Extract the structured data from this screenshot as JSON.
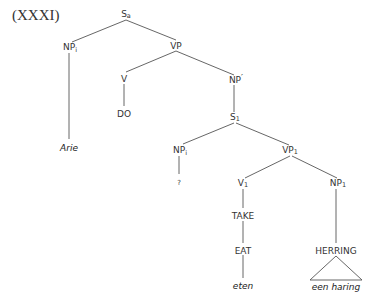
{
  "figure": {
    "number_label": "(XXXI)"
  },
  "tree": {
    "root": {
      "cat": "S",
      "sub": "a"
    },
    "subject": {
      "cat": "NP",
      "sub": "i",
      "lexical": "Arie"
    },
    "vp": {
      "cat": "VP",
      "sub": ""
    },
    "v": {
      "cat": "V",
      "terminal": "DO"
    },
    "np_prime": {
      "cat": "NP",
      "prime": "′"
    },
    "s1": {
      "cat": "S",
      "sub": "1"
    },
    "embedded_subject": {
      "cat": "NP",
      "sub": "i",
      "terminal": "?"
    },
    "vp1": {
      "cat": "VP",
      "sub": "1"
    },
    "v1": {
      "cat": "V",
      "sub": "1",
      "chain": [
        "TAKE",
        "EAT"
      ],
      "lexical": "eten"
    },
    "np1": {
      "cat": "NP",
      "sub": "1",
      "terminal": "HERRING",
      "lexical": "een haring"
    }
  }
}
